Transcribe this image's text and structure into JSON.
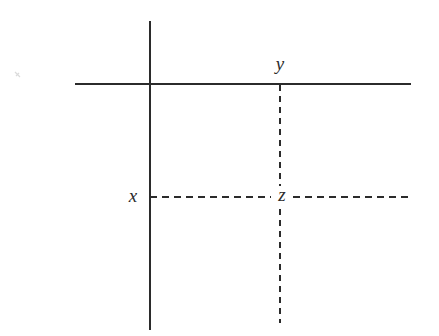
{
  "diagram": {
    "background_color": "#ffffff",
    "stroke_color": "#2b2b2b",
    "canvas": {
      "width": 439,
      "height": 336
    },
    "labels": {
      "x": "x",
      "y": "y",
      "z": "z"
    },
    "label_positions": {
      "x": {
        "x": 133,
        "y": 198
      },
      "y": {
        "x": 280,
        "y": 66
      },
      "z": {
        "x": 282,
        "y": 197
      }
    },
    "solid_lines": [
      {
        "name": "vertical-solid-line",
        "orientation": "vertical",
        "x1": 150,
        "y1": 21,
        "x2": 150,
        "y2": 330,
        "stroke_width": 2,
        "style": "solid"
      },
      {
        "name": "horizontal-solid-line",
        "orientation": "horizontal",
        "x1": 75,
        "y1": 84,
        "x2": 411,
        "y2": 84,
        "stroke_width": 2,
        "style": "solid"
      }
    ],
    "dashed_lines": [
      {
        "name": "vertical-dashed-line",
        "orientation": "vertical",
        "x1": 280,
        "y1": 85,
        "x2": 280,
        "y2": 323,
        "stroke_width": 2,
        "style": "dashed",
        "dash_pattern": "6 5",
        "gap_for_label": {
          "from": 186,
          "to": 209
        }
      },
      {
        "name": "horizontal-dashed-line",
        "orientation": "horizontal",
        "x1": 150,
        "y1": 197,
        "x2": 411,
        "y2": 197,
        "stroke_width": 2,
        "style": "dashed",
        "dash_pattern": "7 5",
        "gap_for_label": {
          "from": 271,
          "to": 293
        }
      }
    ],
    "intersections": [
      {
        "name": "solid-solid-intersection",
        "x": 150,
        "y": 84
      },
      {
        "name": "point-y",
        "x": 280,
        "y": 84
      },
      {
        "name": "point-x",
        "x": 150,
        "y": 197
      },
      {
        "name": "point-z",
        "x": 280,
        "y": 197
      }
    ],
    "artifacts": [
      {
        "name": "scan-speck",
        "x": 17,
        "y": 74,
        "width": 5,
        "height": 5,
        "color": "#c8c8c8"
      }
    ]
  }
}
